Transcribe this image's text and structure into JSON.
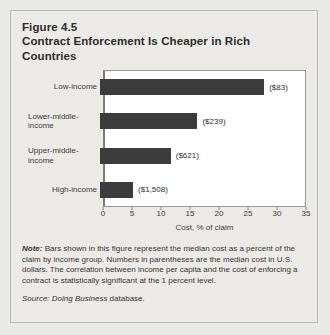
{
  "figure": {
    "number": "Figure 4.5",
    "title": "Contract Enforcement Is Cheaper in Rich Countries"
  },
  "notes": {
    "lead": "Note:",
    "body": " Bars shown in this figure represent the median cost as a percent of the claim by income group. Numbers in parentheses are the median cost in U.S. dollars. The correlation between income per capita and the cost of enforcing a contract is statistically significant at the 1 percent level."
  },
  "source": {
    "lead": "Source:",
    "emphasis": " Doing Business",
    "tail": " database."
  },
  "chart_data": {
    "type": "bar",
    "orientation": "horizontal",
    "title": "Contract Enforcement Is Cheaper in Rich Countries",
    "xlabel": "Cost, % of claim",
    "ylabel": "",
    "xlim": [
      0,
      35
    ],
    "xticks": [
      0,
      5,
      10,
      15,
      20,
      25,
      30,
      35
    ],
    "xtick_labels": [
      "0",
      "5",
      "10",
      "15",
      "20",
      "25",
      "30",
      "35"
    ],
    "grid": false,
    "legend": false,
    "bar_color": "#3c3c3c",
    "categories": [
      "Low-income",
      "Lower-middle-income",
      "Upper-middle-income",
      "High-income"
    ],
    "values": [
      28.3,
      16.8,
      12.2,
      5.7
    ],
    "data_labels": [
      "($83)",
      "($239)",
      "($621)",
      "($1,508)"
    ],
    "points": [
      {
        "category_line1": "Low-income",
        "category_line2": "",
        "value": 28.3,
        "label": "($83)"
      },
      {
        "category_line1": "Lower-middle-",
        "category_line2": "income",
        "value": 16.8,
        "label": "($239)"
      },
      {
        "category_line1": "Upper-middle-",
        "category_line2": "income",
        "value": 12.2,
        "label": "($621)"
      },
      {
        "category_line1": "High-income",
        "category_line2": "",
        "value": 5.7,
        "label": "($1,508)"
      }
    ]
  }
}
